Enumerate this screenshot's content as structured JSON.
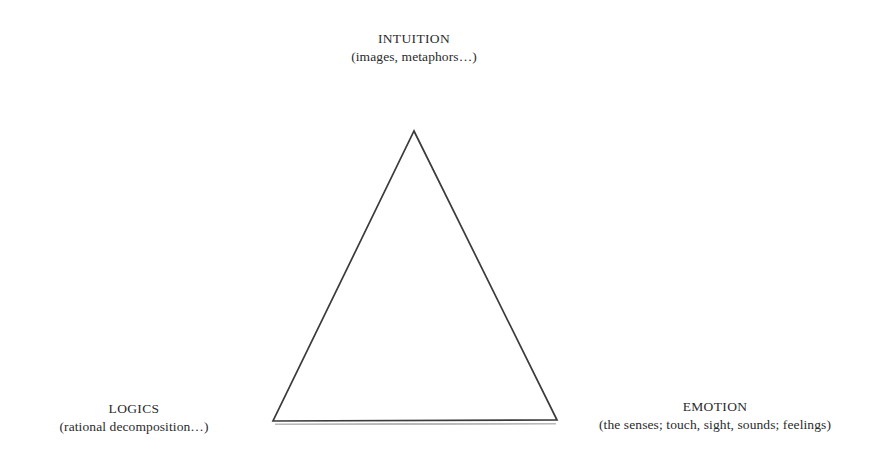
{
  "diagram": {
    "background_color": "#ffffff",
    "stroke_color": "#3a3a3a",
    "text_color": "#2b2b2b",
    "vertices": {
      "top": {
        "title": "INTUITION",
        "subtitle": "(images, metaphors…)",
        "point": {
          "x": 414,
          "y": 131
        }
      },
      "bottom_left": {
        "title": "LOGICS",
        "subtitle": "(rational decomposition…)",
        "point": {
          "x": 273,
          "y": 421
        }
      },
      "bottom_right": {
        "title": "EMOTION",
        "subtitle": "(the senses; touch, sight, sounds; feelings)",
        "point": {
          "x": 557,
          "y": 420
        }
      }
    }
  },
  "chart_data": {
    "type": "diagram",
    "shape": "triangle",
    "title": "",
    "nodes": [
      {
        "id": "intuition",
        "label": "INTUITION",
        "detail": "(images, metaphors…)",
        "position": "top",
        "x": 414,
        "y": 131
      },
      {
        "id": "logics",
        "label": "LOGICS",
        "detail": "(rational decomposition…)",
        "position": "bottom-left",
        "x": 273,
        "y": 421
      },
      {
        "id": "emotion",
        "label": "EMOTION",
        "detail": "(the senses; touch, sight, sounds; feelings)",
        "position": "bottom-right",
        "x": 557,
        "y": 420
      }
    ],
    "edges": [
      {
        "from": "intuition",
        "to": "logics"
      },
      {
        "from": "logics",
        "to": "emotion"
      },
      {
        "from": "emotion",
        "to": "intuition"
      }
    ],
    "legend": [],
    "grid": false
  }
}
